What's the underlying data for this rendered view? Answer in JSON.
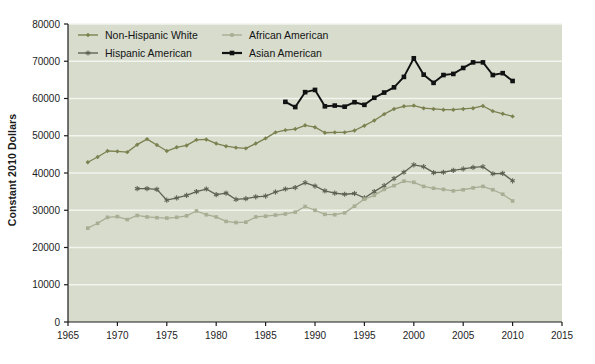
{
  "chart_data": {
    "type": "line",
    "title": "",
    "subtitle": "",
    "xlabel": "",
    "ylabel": "Constant 2010 Dollars",
    "xlim": [
      1965,
      2015
    ],
    "ylim": [
      0,
      80000
    ],
    "xticks": [
      1965,
      1970,
      1975,
      1980,
      1985,
      1990,
      1995,
      2000,
      2005,
      2010,
      2015
    ],
    "yticks": [
      0,
      10000,
      20000,
      30000,
      40000,
      50000,
      60000,
      70000,
      80000
    ],
    "grid": "horizontal",
    "legend_position": "top-left-inside",
    "plot_background": "#d7dccd",
    "gridline_color": "#f2f4ee",
    "series": [
      {
        "name": "Non-Hispanic White",
        "color": "#7c8150",
        "marker": "diamond",
        "x": [
          1967,
          1968,
          1969,
          1970,
          1971,
          1972,
          1973,
          1974,
          1975,
          1976,
          1977,
          1978,
          1979,
          1980,
          1981,
          1982,
          1983,
          1984,
          1985,
          1986,
          1987,
          1988,
          1989,
          1990,
          1991,
          1992,
          1993,
          1994,
          1995,
          1996,
          1997,
          1998,
          1999,
          2000,
          2001,
          2002,
          2003,
          2004,
          2005,
          2006,
          2007,
          2008,
          2009,
          2010
        ],
        "values": [
          42900,
          44300,
          45900,
          45800,
          45600,
          47600,
          49100,
          47500,
          45900,
          46900,
          47400,
          48900,
          49000,
          47900,
          47200,
          46800,
          46600,
          47900,
          49300,
          50900,
          51500,
          51800,
          52800,
          52300,
          50800,
          50900,
          50900,
          51400,
          52700,
          54100,
          55800,
          57200,
          57900,
          58100,
          57400,
          57200,
          57000,
          57000,
          57200,
          57400,
          58000,
          56600,
          55900,
          55200
        ]
      },
      {
        "name": "Hispanic American",
        "color": "#5d6352",
        "marker": "star",
        "x": [
          1972,
          1973,
          1974,
          1975,
          1976,
          1977,
          1978,
          1979,
          1980,
          1981,
          1982,
          1983,
          1984,
          1985,
          1986,
          1987,
          1988,
          1989,
          1990,
          1991,
          1992,
          1993,
          1994,
          1995,
          1996,
          1997,
          1998,
          1999,
          2000,
          2001,
          2002,
          2003,
          2004,
          2005,
          2006,
          2007,
          2008,
          2009,
          2010
        ],
        "values": [
          35800,
          35800,
          35600,
          32700,
          33300,
          34000,
          35000,
          35700,
          34200,
          34600,
          32900,
          33100,
          33600,
          33800,
          34900,
          35700,
          36100,
          37400,
          36500,
          35200,
          34600,
          34300,
          34500,
          33300,
          35000,
          36600,
          38500,
          40200,
          42200,
          41700,
          40100,
          40200,
          40700,
          41100,
          41500,
          41700,
          39800,
          39900,
          37900
        ]
      },
      {
        "name": "African American",
        "color": "#a8ad94",
        "marker": "square",
        "x": [
          1967,
          1968,
          1969,
          1970,
          1971,
          1972,
          1973,
          1974,
          1975,
          1976,
          1977,
          1978,
          1979,
          1980,
          1981,
          1982,
          1983,
          1984,
          1985,
          1986,
          1987,
          1988,
          1989,
          1990,
          1991,
          1992,
          1993,
          1994,
          1995,
          1996,
          1997,
          1998,
          1999,
          2000,
          2001,
          2002,
          2003,
          2004,
          2005,
          2006,
          2007,
          2008,
          2009,
          2010
        ],
        "values": [
          25200,
          26500,
          28100,
          28300,
          27500,
          28600,
          28200,
          28000,
          27900,
          28100,
          28500,
          29800,
          28800,
          28200,
          27000,
          26700,
          26800,
          28200,
          28400,
          28700,
          29000,
          29500,
          31000,
          30000,
          28900,
          28800,
          29300,
          31100,
          33000,
          34000,
          35600,
          36600,
          37800,
          37500,
          36400,
          35900,
          35600,
          35200,
          35500,
          36000,
          36400,
          35500,
          34300,
          32500
        ]
      },
      {
        "name": "Asian American",
        "color": "#111111",
        "marker": "square-filled",
        "x": [
          1987,
          1988,
          1989,
          1990,
          1991,
          1992,
          1993,
          1994,
          1995,
          1996,
          1997,
          1998,
          1999,
          2000,
          2001,
          2002,
          2003,
          2004,
          2005,
          2006,
          2007,
          2008,
          2009,
          2010
        ],
        "values": [
          59100,
          57700,
          61700,
          62300,
          57900,
          58100,
          57800,
          59000,
          58300,
          60200,
          61600,
          63000,
          65800,
          70800,
          66400,
          64200,
          66300,
          66600,
          68200,
          69700,
          69700,
          66300,
          66800,
          64700
        ]
      }
    ],
    "legend_entries": [
      {
        "label": "Non-Hispanic White",
        "color": "#7c8150",
        "marker": "diamond"
      },
      {
        "label": "African American",
        "color": "#a8ad94",
        "marker": "square"
      },
      {
        "label": "Hispanic American",
        "color": "#5d6352",
        "marker": "star"
      },
      {
        "label": "Asian American",
        "color": "#111111",
        "marker": "square-filled"
      }
    ]
  }
}
